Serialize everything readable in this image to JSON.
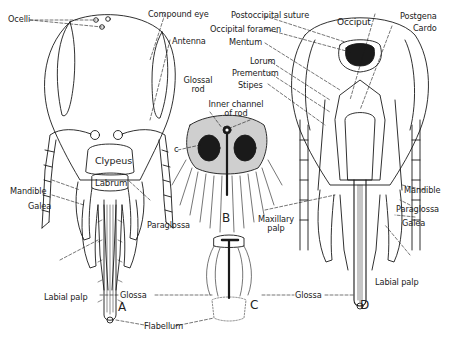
{
  "diagram": {
    "figures": [
      {
        "id": "A",
        "label": "A",
        "view": "anterior view of head with proboscis"
      },
      {
        "id": "B",
        "label": "B",
        "view": "cross section of glossa"
      },
      {
        "id": "C",
        "label": "C",
        "view": "tip of glossa with flabellum"
      },
      {
        "id": "D",
        "label": "D",
        "view": "posterior view of head with proboscis"
      }
    ],
    "labels": {
      "ocelli": "Ocelli",
      "compound_eye": "Compound eye",
      "antenna": "Antenna",
      "clypeus": "Clypeus",
      "labrum": "Labrum",
      "mandible_left": "Mandible",
      "galea_left": "Galea",
      "paraglossa_left": "Paraglossa",
      "labial_palp_left": "Labial palp",
      "glossa_left": "Glossa",
      "flabellum": "Flabellum",
      "glossal_rod_1": "Glossal",
      "glossal_rod_2": "rod",
      "inner_channel_1": "Inner channel",
      "inner_channel_2": "of rod",
      "c_marker": "c",
      "postoccipital_suture": "Postoccipital suture",
      "occipital_foramen": "Occipital foramen",
      "mentum": "Mentum",
      "lorum": "Lorum",
      "prementum": "Prementum",
      "stipes": "Stipes",
      "occiput": "Occiput",
      "postgena": "Postgena",
      "cardo": "Cardo",
      "maxillary_palp_1": "Maxillary",
      "maxillary_palp_2": "palp",
      "mandible_right": "Mandible",
      "paraglossa_right": "Paraglossa",
      "galea_right": "Galea",
      "labial_palp_right": "Labial palp",
      "glossa_right": "Glossa"
    },
    "colors": {
      "ink": "#1a1a1a",
      "background": "#ffffff"
    }
  }
}
